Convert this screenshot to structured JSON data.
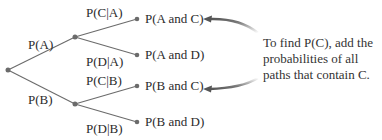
{
  "diagram": {
    "type": "probability-tree",
    "branches": {
      "first_level": [
        {
          "id": "A",
          "label": "P(A)"
        },
        {
          "id": "B",
          "label": "P(B)"
        }
      ],
      "second_level": [
        {
          "parent": "A",
          "label": "P(C|A)",
          "outcome": "P(A and C)"
        },
        {
          "parent": "A",
          "label": "P(D|A)",
          "outcome": "P(A and D)"
        },
        {
          "parent": "B",
          "label": "P(C|B)",
          "outcome": "P(B and C)"
        },
        {
          "parent": "B",
          "label": "P(D|B)",
          "outcome": "P(B and D)"
        }
      ]
    },
    "annotation": {
      "line1": "To find P(C), add the",
      "line2": "probabilities of all",
      "line3": "paths that contain C.",
      "points_to": [
        "P(A and C)",
        "P(B and C)"
      ]
    },
    "colors": {
      "line": "#6b6b6b",
      "node": "#6b6b6b",
      "arrow": "#555555",
      "text": "#2b2b2b"
    }
  }
}
